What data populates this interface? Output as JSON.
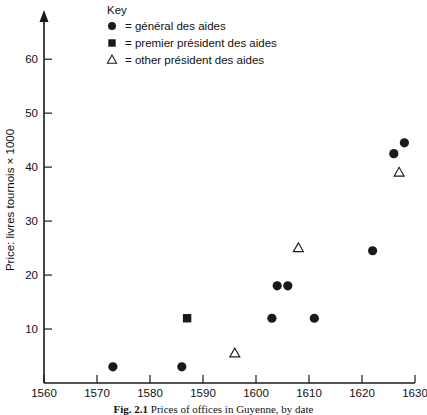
{
  "chart_data": {
    "type": "scatter",
    "title": "",
    "xlabel": "",
    "ylabel": "Price: livres tournois × 1000",
    "xlim": [
      1560,
      1630
    ],
    "ylim": [
      0,
      68
    ],
    "grid": false,
    "legend_position": "top-left-inside",
    "xticks": [
      1560,
      1570,
      1580,
      1590,
      1600,
      1610,
      1620,
      1630
    ],
    "yticks": [
      10,
      20,
      30,
      40,
      50,
      60
    ],
    "legend_title": "Key",
    "series": [
      {
        "name": "général des aides",
        "marker": "filled-circle",
        "legend_text": "= général des aides",
        "points": [
          {
            "x": 1573,
            "y": 3
          },
          {
            "x": 1586,
            "y": 3
          },
          {
            "x": 1603,
            "y": 12
          },
          {
            "x": 1604,
            "y": 18
          },
          {
            "x": 1606,
            "y": 18
          },
          {
            "x": 1611,
            "y": 12
          },
          {
            "x": 1622,
            "y": 24.5
          },
          {
            "x": 1626,
            "y": 42.5
          },
          {
            "x": 1628,
            "y": 44.5
          }
        ]
      },
      {
        "name": "premier président des aides",
        "marker": "filled-square",
        "legend_text": "= premier président des aides",
        "points": [
          {
            "x": 1587,
            "y": 12
          }
        ]
      },
      {
        "name": "other président des aides",
        "marker": "open-triangle",
        "legend_text": "= other président des aides",
        "points": [
          {
            "x": 1596,
            "y": 5.5
          },
          {
            "x": 1608,
            "y": 25
          },
          {
            "x": 1627,
            "y": 39
          }
        ]
      }
    ]
  },
  "caption": {
    "figure_number": "Fig. 2.1",
    "text": "Prices of offices in Guyenne, by date"
  }
}
